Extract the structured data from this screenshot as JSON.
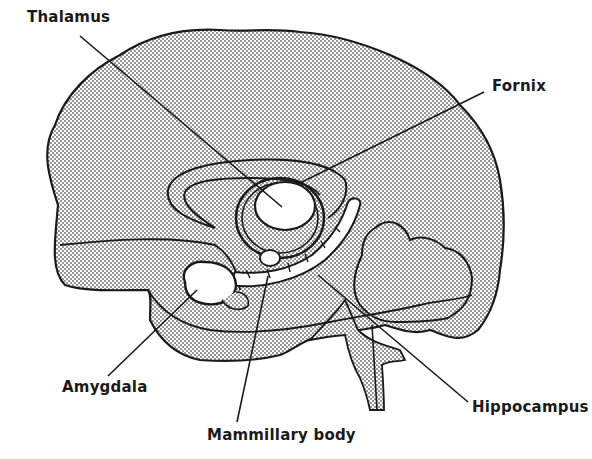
{
  "diagram": {
    "colors": {
      "outline": "#1a1a1a",
      "stipple": "#9a9a9a",
      "background": "#ffffff",
      "structure_fill": "#ffffff"
    },
    "labels": [
      {
        "id": "thalamus",
        "text": "Thalamus",
        "x": 27,
        "y": 16,
        "line": [
          [
            80,
            36
          ],
          [
            282,
            207
          ]
        ]
      },
      {
        "id": "fornix",
        "text": "Fornix",
        "x": 492,
        "y": 75,
        "line": [
          [
            484,
            92
          ],
          [
            298,
            184
          ]
        ]
      },
      {
        "id": "amygdala",
        "text": "Amygdala",
        "x": 63,
        "y": 380,
        "line": [
          [
            108,
            376
          ],
          [
            197,
            290
          ]
        ]
      },
      {
        "id": "mammillary-body",
        "text": "Mammillary body",
        "x": 207,
        "y": 427,
        "line": [
          [
            237,
            422
          ],
          [
            268,
            276
          ]
        ]
      },
      {
        "id": "hippocampus",
        "text": "Hippocampus",
        "x": 472,
        "y": 399,
        "line": [
          [
            468,
            402
          ],
          [
            318,
            275
          ]
        ]
      }
    ]
  }
}
